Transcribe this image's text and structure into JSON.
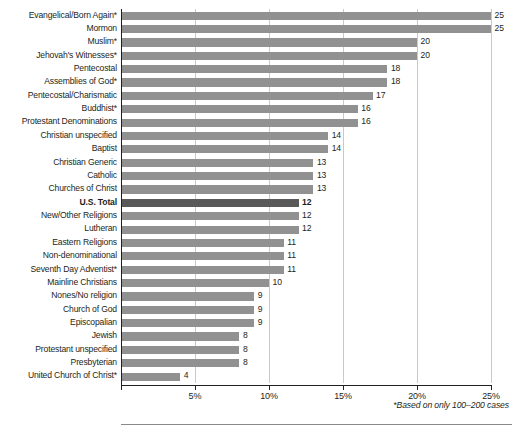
{
  "chart_data": {
    "type": "bar",
    "orientation": "horizontal",
    "title": "",
    "subtitle": "",
    "xlabel": "",
    "ylabel": "",
    "xlim": [
      0,
      25
    ],
    "grid": true,
    "legend": null,
    "footnote": "*Based on only 100–200 cases",
    "xticks": [
      0,
      5,
      10,
      15,
      20,
      25
    ],
    "xtick_labels": [
      "",
      "5%",
      "10%",
      "15%",
      "20%",
      "25%"
    ],
    "value_suffix": "",
    "highlight_category": "U.S. Total",
    "colors": {
      "bar": "#919191",
      "bar_highlight": "#595959",
      "gridline": "#c9c9c9",
      "axis": "#231f20",
      "text": "#231f20",
      "background": "#ffffff"
    },
    "categories": [
      "Evangelical/Born Again*",
      "Mormon",
      "Muslim*",
      "Jehovah's Witnesses*",
      "Pentecostal",
      "Assemblies of God*",
      "Pentecostal/Charismatic",
      "Buddhist*",
      "Protestant Denominations",
      "Christian unspecified",
      "Baptist",
      "Christian Generic",
      "Catholic",
      "Churches of Christ",
      "U.S. Total",
      "New/Other Religions",
      "Lutheran",
      "Eastern Religions",
      "Non-denominational",
      "Seventh Day Adventist*",
      "Mainline Christians",
      "Nones/No religion",
      "Church of God",
      "Episcopalian",
      "Jewish",
      "Protestant unspecified",
      "Presbyterian",
      "United Church of Christ*"
    ],
    "values": [
      25,
      25,
      20,
      20,
      18,
      18,
      17,
      16,
      16,
      14,
      14,
      13,
      13,
      13,
      12,
      12,
      12,
      11,
      11,
      11,
      10,
      9,
      9,
      9,
      8,
      8,
      8,
      4
    ],
    "value_labels": [
      "25",
      "25",
      "20",
      "20",
      "18",
      "18",
      "17",
      "16",
      "16",
      "14",
      "14",
      "13",
      "13",
      "13",
      "12",
      "12",
      "12",
      "11",
      "11",
      "11",
      "10",
      "9",
      "9",
      "9",
      "8",
      "8",
      "8",
      "4"
    ]
  }
}
